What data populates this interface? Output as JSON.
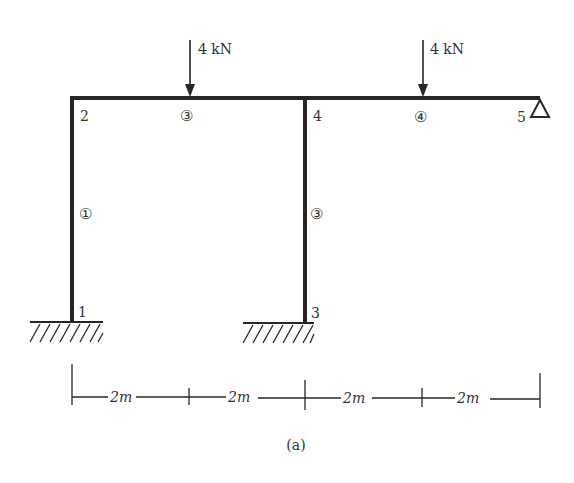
{
  "figure": {
    "caption": "(a)",
    "loads": [
      {
        "label": "4 kN",
        "x": 189
      },
      {
        "label": "4 kN",
        "x": 422
      }
    ],
    "nodes": [
      {
        "id": "1",
        "label": "1"
      },
      {
        "id": "2",
        "label": "2"
      },
      {
        "id": "3",
        "label": "3"
      },
      {
        "id": "4",
        "label": "4"
      },
      {
        "id": "5",
        "label": "5"
      }
    ],
    "elements": [
      {
        "label": "①"
      },
      {
        "label": "③"
      },
      {
        "label": "③"
      },
      {
        "label": "④"
      }
    ],
    "dimensions": [
      "2m",
      "2m",
      "2m",
      "2m"
    ],
    "colors": {
      "line": "#2a2522",
      "text": "#333333"
    }
  }
}
